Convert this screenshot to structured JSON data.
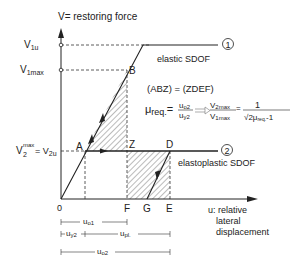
{
  "axes": {
    "y_label": "V= restoring force",
    "x_label_lines": [
      "u: relative",
      "lateral",
      "displacement"
    ],
    "origin": "0"
  },
  "y_ticks": {
    "v1u": {
      "main": "V",
      "sub": "1u"
    },
    "v1max": {
      "main": "V",
      "sub": "1max"
    },
    "v2": {
      "main": "V",
      "sub": "2",
      "sup": "max",
      "eq": "= V",
      "sub2": "2u"
    }
  },
  "points": {
    "A": "A",
    "B": "B",
    "Z": "Z",
    "D": "D",
    "F": "F",
    "G": "G",
    "E": "E"
  },
  "curves": {
    "elastic": {
      "label": "elastic SDOF",
      "marker": "1"
    },
    "elastoplastic": {
      "label": "elastoplastic SDOF",
      "marker": "2"
    }
  },
  "annotations": {
    "area_equality": "(ABZ) = (ZDEF)",
    "mu_req": "μ",
    "mu_req_sub": "req.",
    "eq": "=",
    "frac1_num": "u",
    "frac1_num_sub": "o2",
    "frac1_den": "u",
    "frac1_den_sub": "y2",
    "frac2_num": "V",
    "frac2_num_sub": "2max",
    "frac2_den": "V",
    "frac2_den_sub": "1max",
    "frac3_num": "1",
    "frac3_den": "√2μ",
    "frac3_den_sub": "req.",
    "frac3_den_tail": "-1"
  },
  "dimensions": {
    "uo1": {
      "main": "u",
      "sub": "o1"
    },
    "uy2": {
      "main": "u",
      "sub": "y2"
    },
    "upl": {
      "main": "u",
      "sub": "pl."
    },
    "uo2": {
      "main": "u",
      "sub": "o2"
    }
  }
}
